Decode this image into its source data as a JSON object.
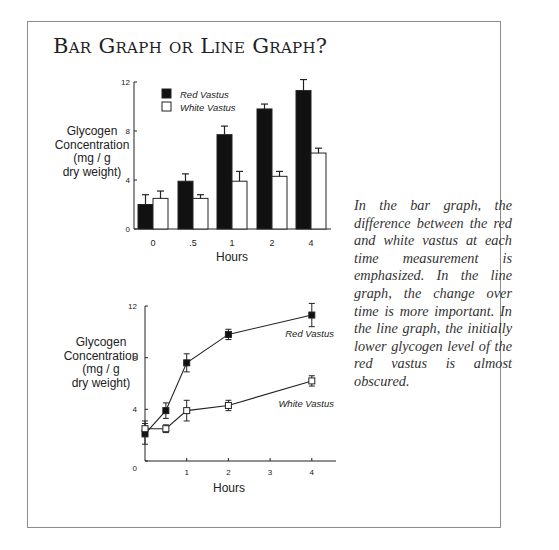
{
  "page": {
    "title": "Bar Graph or Line Graph?",
    "caption": "In the bar graph, the differ­ence between the red and white vastus at each time measurement is emphasized. In the line graph, the change over time is more important. In the line graph, the initially lower glycogen level of the red vastus is almost obscured."
  },
  "colors": {
    "red_vastus": "#111111",
    "white_vastus": "#ffffff",
    "axis": "#222222",
    "frame": "#8c8c8c"
  },
  "chart_data": [
    {
      "type": "bar",
      "title": "",
      "xlabel": "Hours",
      "ylabel": "Glycogen Concentration (mg / g dry weight)",
      "ylabel_lines": [
        "Glycogen",
        "Concentration",
        "(mg / g",
        "dry weight)"
      ],
      "categories": [
        "0",
        ".5",
        "1",
        "2",
        "4"
      ],
      "ylim": [
        0,
        12
      ],
      "yticks": [
        0,
        4,
        8,
        12
      ],
      "grid": false,
      "legend_position": "upper-left-inside",
      "series": [
        {
          "name": "Red Vastus",
          "fill": "#111111",
          "values": [
            2.0,
            3.9,
            7.7,
            9.8,
            11.3
          ],
          "errors": [
            0.8,
            0.6,
            0.7,
            0.4,
            0.9
          ]
        },
        {
          "name": "White Vastus",
          "fill": "#ffffff",
          "values": [
            2.5,
            2.5,
            3.9,
            4.3,
            6.2
          ],
          "errors": [
            0.6,
            0.3,
            0.8,
            0.4,
            0.4
          ]
        }
      ]
    },
    {
      "type": "line",
      "title": "",
      "xlabel": "Hours",
      "ylabel": "Glycogen Concentration (mg / g dry weight)",
      "ylabel_lines": [
        "Glycogen",
        "Concentration",
        "(mg / g",
        "dry weight)"
      ],
      "x": [
        0,
        0.5,
        1,
        2,
        4
      ],
      "xticks": [
        1,
        2,
        3,
        4
      ],
      "xlim": [
        0,
        4.5
      ],
      "ylim": [
        0,
        12
      ],
      "yticks": [
        0,
        4,
        8,
        12
      ],
      "grid": false,
      "series": [
        {
          "name": "Red Vastus",
          "marker": "filled-square",
          "label_position": "above-right",
          "values": [
            2.1,
            3.9,
            7.6,
            9.8,
            11.3
          ],
          "errors": [
            0.8,
            0.6,
            0.7,
            0.4,
            0.9
          ]
        },
        {
          "name": "White Vastus",
          "marker": "open-square",
          "label_position": "below-right",
          "values": [
            2.5,
            2.5,
            3.9,
            4.3,
            6.2
          ],
          "errors": [
            0.6,
            0.3,
            0.8,
            0.4,
            0.4
          ]
        }
      ]
    }
  ]
}
